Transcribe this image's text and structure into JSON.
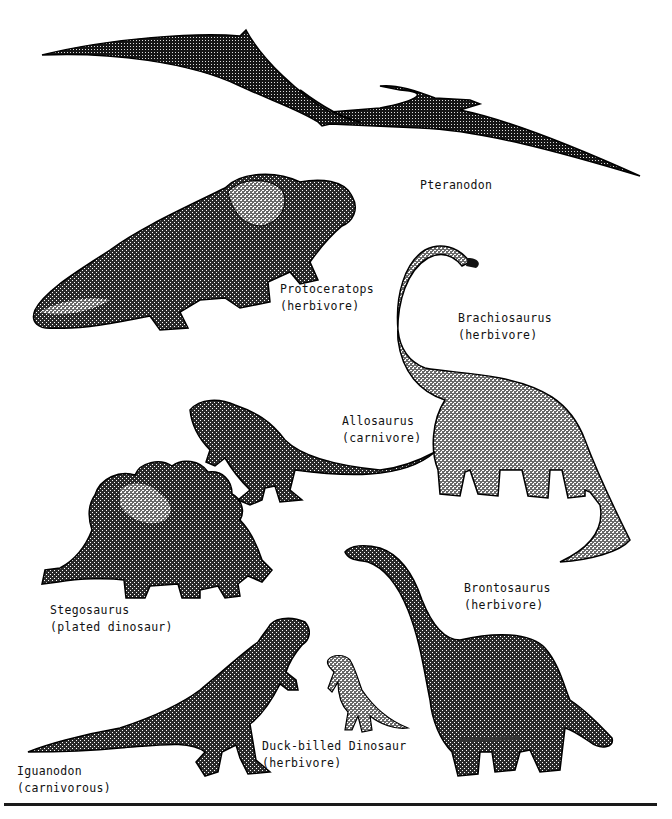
{
  "page": {
    "background": "#ffffff",
    "ink_color": "#111111"
  },
  "dinosaurs": [
    {
      "id": "pteranodon",
      "name": "Pteranodon",
      "note": ""
    },
    {
      "id": "protoceratops",
      "name": "Protoceratops",
      "note": "(herbivore)"
    },
    {
      "id": "brachiosaurus",
      "name": "Brachiosaurus",
      "note": "(herbivore)"
    },
    {
      "id": "allosaurus",
      "name": "Allosaurus",
      "note": "(carnivore)"
    },
    {
      "id": "stegosaurus",
      "name": "Stegosaurus",
      "note": "(plated dinosaur)"
    },
    {
      "id": "brontosaurus",
      "name": "Brontosaurus",
      "note": "(herbivore)"
    },
    {
      "id": "duck-billed",
      "name": "Duck-billed Dinosaur",
      "note": "(herbivore)"
    },
    {
      "id": "iguanodon",
      "name": "Iguanodon",
      "note": "(carnivorous)"
    }
  ]
}
